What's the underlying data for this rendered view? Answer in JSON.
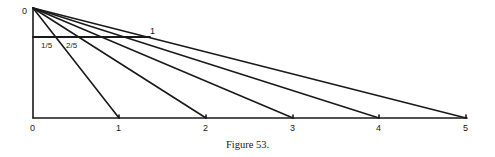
{
  "diagram": {
    "type": "geometric-construction",
    "apex_label": "0",
    "unit_label": "1",
    "fraction_labels": [
      "1/5",
      "2/5"
    ],
    "baseline_labels": [
      "0",
      "1",
      "2",
      "3",
      "4",
      "5"
    ],
    "caption": "Figure 53.",
    "line_color": "#1a1a1a"
  }
}
